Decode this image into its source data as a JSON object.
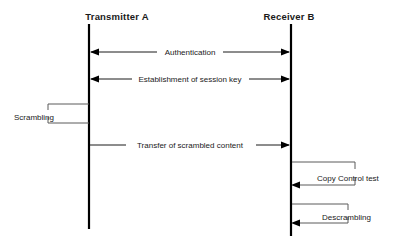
{
  "diagram": {
    "type": "sequence-diagram",
    "background_color": "#ffffff",
    "line_color": "#1a1a1a",
    "loop_line_color": "#5a5a5a",
    "actors": [
      {
        "id": "transmitter",
        "label": "Transmitter A",
        "x": 117,
        "lifeline_x": 89,
        "lifeline_top": 24,
        "lifeline_bottom": 229
      },
      {
        "id": "receiver",
        "label": "Receiver B",
        "x": 289,
        "lifeline_x": 291,
        "lifeline_top": 24,
        "lifeline_bottom": 236
      }
    ],
    "messages": [
      {
        "id": "authentication",
        "label": "Authentication",
        "from": "transmitter",
        "to": "receiver",
        "y": 52,
        "direction": "bidirectional",
        "label_x": 190
      },
      {
        "id": "session-key",
        "label": "Establishment of session key",
        "from": "transmitter",
        "to": "receiver",
        "y": 79,
        "direction": "bidirectional",
        "label_x": 190
      },
      {
        "id": "scrambled-content",
        "label": "Transfer of scrambled content",
        "from": "transmitter",
        "to": "receiver",
        "y": 145,
        "direction": "right",
        "label_x": 190
      }
    ],
    "self_loops": [
      {
        "id": "scrambling",
        "label": "Scrambling",
        "actor": "transmitter",
        "side": "left",
        "top_y": 104,
        "bottom_y": 123,
        "extent_x": 48,
        "label_x": 14,
        "label_y": 117,
        "arrowhead": false
      },
      {
        "id": "copy-control-test",
        "label": "Copy Control test",
        "actor": "receiver",
        "side": "right",
        "top_y": 162,
        "bottom_y": 185,
        "extent_x": 355,
        "label_x": 317,
        "label_y": 178,
        "arrowhead": true
      },
      {
        "id": "descrambling",
        "label": "Descrambling",
        "actor": "receiver",
        "side": "right",
        "top_y": 204,
        "bottom_y": 223,
        "extent_x": 348,
        "label_x": 322,
        "label_y": 218,
        "arrowhead": true
      }
    ]
  }
}
